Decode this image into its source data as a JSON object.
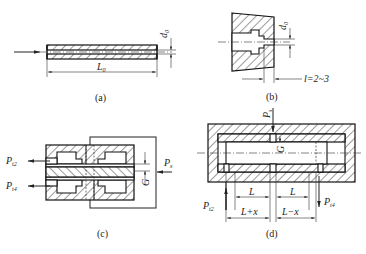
{
  "figure": {
    "panels": [
      {
        "id": "a",
        "caption": "(a)",
        "labels": {
          "diameter": "d",
          "diameter_sub": "0",
          "length": "L",
          "length_sub": "0"
        }
      },
      {
        "id": "b",
        "caption": "(b)",
        "labels": {
          "diameter": "d",
          "diameter_sub": "0",
          "length_eq": "l=2~3"
        }
      },
      {
        "id": "c",
        "caption": "(c)",
        "labels": {
          "outlet_top": "P",
          "outlet_top_sub": "t2",
          "outlet_bottom": "P",
          "outlet_bottom_sub": "t4",
          "inlet": "P",
          "inlet_sub": "s",
          "gap": "G"
        }
      },
      {
        "id": "d",
        "caption": "(d)",
        "labels": {
          "inlet": "P",
          "inlet_sub": "s",
          "gap": "G",
          "left_len": "L",
          "right_len": "L",
          "left_disp": "L+x",
          "right_disp": "L−x",
          "outlet_left": "P",
          "outlet_left_sub": "t2",
          "outlet_right": "P",
          "outlet_right_sub": "t4"
        }
      }
    ]
  }
}
